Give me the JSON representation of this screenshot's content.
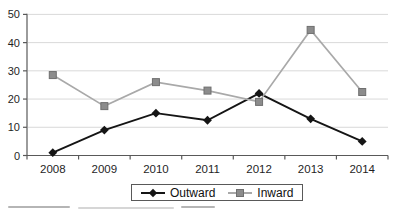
{
  "chart_data": {
    "type": "line",
    "title": "",
    "xlabel": "",
    "ylabel": "",
    "categories": [
      "2008",
      "2009",
      "2010",
      "2011",
      "2012",
      "2013",
      "2014"
    ],
    "series": [
      {
        "name": "Outward",
        "values": [
          1,
          9,
          15,
          12.5,
          22,
          13,
          5
        ],
        "line_color": "#151515",
        "marker": "diamond",
        "marker_color": "#151515"
      },
      {
        "name": "Inward",
        "values": [
          28.5,
          17.5,
          26,
          23,
          19,
          44.5,
          22.5
        ],
        "line_color": "#a9a9a9",
        "marker": "square",
        "marker_color": "#8c8c8c",
        "marker_edge_color": "#6f6f6f"
      }
    ],
    "ylim": [
      0,
      50
    ],
    "yticks": [
      "0",
      "10",
      "20",
      "30",
      "40",
      "50"
    ],
    "grid": "horizontal",
    "gridline_color": "#d9d9d9",
    "axis_color": "#595959",
    "tick_label_color": "#1f1f1f",
    "legend_position": "bottom-center"
  },
  "legend": {
    "outward_label": "Outward",
    "inward_label": "Inward"
  }
}
